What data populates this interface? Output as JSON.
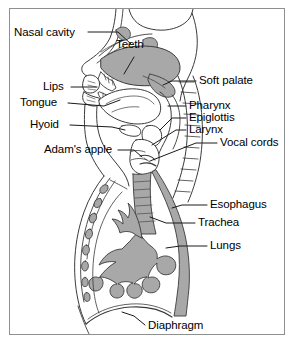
{
  "figure": {
    "border_color": "#8f8f8f",
    "background_color": "#ffffff",
    "tissue_fill_color": "#a8a8a8",
    "outline_color": "#3a3a3a",
    "leader_line_color": "#1a1a1a"
  },
  "labels": {
    "nasal_cavity": "Nasal cavity",
    "teeth": "Teeth",
    "lips": "Lips",
    "tongue": "Tongue",
    "hyoid": "Hyoid",
    "adams_apple": "Adam's apple",
    "soft_palate": "Soft palate",
    "pharynx": "Pharynx",
    "epiglottis": "Epiglottis",
    "larynx": "Larynx",
    "vocal_cords": "Vocal cords",
    "esophagus": "Esophagus",
    "trachea": "Trachea",
    "lungs": "Lungs",
    "diaphragm": "Diaphragm"
  },
  "label_positions": {
    "nasal_cavity": {
      "x": 14,
      "y": 33,
      "side": "left"
    },
    "teeth": {
      "x": 116,
      "y": 45,
      "side": "none"
    },
    "lips": {
      "x": 49,
      "y": 88,
      "side": "left"
    },
    "tongue": {
      "x": 22,
      "y": 104,
      "side": "left"
    },
    "hyoid": {
      "x": 40,
      "y": 126,
      "side": "left"
    },
    "adams_apple": {
      "x": 48,
      "y": 151,
      "side": "left"
    },
    "soft_palate": {
      "x": 198,
      "y": 81,
      "side": "right"
    },
    "pharynx": {
      "x": 188,
      "y": 106,
      "side": "right"
    },
    "epiglottis": {
      "x": 188,
      "y": 118,
      "side": "right"
    },
    "larynx": {
      "x": 188,
      "y": 130,
      "side": "right"
    },
    "vocal_cords": {
      "x": 219,
      "y": 143,
      "side": "right"
    },
    "esophagus": {
      "x": 209,
      "y": 205,
      "side": "right"
    },
    "trachea": {
      "x": 197,
      "y": 223,
      "side": "right"
    },
    "lungs": {
      "x": 209,
      "y": 246,
      "side": "right"
    },
    "diaphragm": {
      "x": 147,
      "y": 327,
      "side": "bottom"
    }
  },
  "structures": [
    {
      "name": "nasal-cavity",
      "kind": "air-space"
    },
    {
      "name": "hard-palate",
      "kind": "tissue"
    },
    {
      "name": "soft-palate",
      "kind": "tissue"
    },
    {
      "name": "teeth",
      "kind": "bone"
    },
    {
      "name": "lips",
      "kind": "tissue"
    },
    {
      "name": "tongue",
      "kind": "tissue"
    },
    {
      "name": "hyoid-bone",
      "kind": "bone"
    },
    {
      "name": "epiglottis",
      "kind": "tissue"
    },
    {
      "name": "larynx",
      "kind": "tissue"
    },
    {
      "name": "thyroid-cartilage",
      "kind": "cartilage"
    },
    {
      "name": "vocal-cords",
      "kind": "tissue"
    },
    {
      "name": "pharynx",
      "kind": "air-space"
    },
    {
      "name": "vertebral-column",
      "kind": "bone"
    },
    {
      "name": "esophagus",
      "kind": "tube"
    },
    {
      "name": "trachea",
      "kind": "tube"
    },
    {
      "name": "bronchial-tree",
      "kind": "tissue"
    },
    {
      "name": "ribs",
      "kind": "bone"
    },
    {
      "name": "diaphragm",
      "kind": "muscle"
    },
    {
      "name": "chest-wall",
      "kind": "outline"
    }
  ]
}
